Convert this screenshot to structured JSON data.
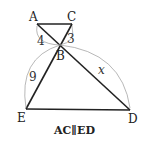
{
  "diagram": {
    "points": {
      "A": {
        "label": "A"
      },
      "C": {
        "label": "C"
      },
      "B": {
        "label": "B"
      },
      "E": {
        "label": "E"
      },
      "D": {
        "label": "D"
      }
    },
    "segments": [
      "AC",
      "AD",
      "CE",
      "ED"
    ],
    "measures": {
      "AB": "4",
      "CB": "3",
      "EB": "9",
      "BD": "x"
    },
    "caption": "AC∥ED"
  }
}
